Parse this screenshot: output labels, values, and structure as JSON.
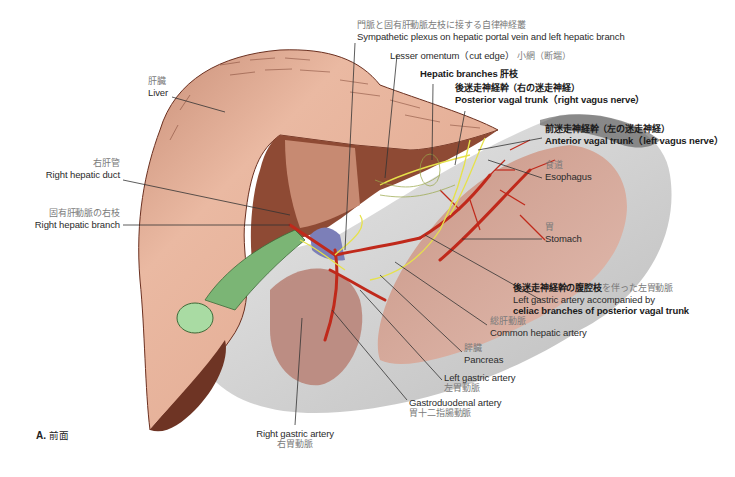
{
  "figure": {
    "caption_letter": "A.",
    "caption_text": "前面",
    "signature": "Netter"
  },
  "labels": {
    "sympathetic_plexus": {
      "jp": "門脈と固有肝動脈左枝に接する自律神経叢",
      "en": "Sympathetic plexus on hepatic portal vein and left hepatic branch"
    },
    "lesser_omentum": {
      "en": "Lesser omentum（cut edge）",
      "jp": "小網（断端）"
    },
    "hepatic_branches": {
      "en": "Hepatic branches",
      "jp": "肝枝"
    },
    "posterior_vagal_trunk": {
      "jp": "後迷走神経幹（右の迷走神経）",
      "en": "Posterior vagal trunk（right vagus nerve）"
    },
    "anterior_vagal_trunk": {
      "jp": "前迷走神経幹（左の迷走神経）",
      "en": "Anterior vagal trunk（left vagus nerve）"
    },
    "esophagus": {
      "jp": "食道",
      "en": "Esophagus"
    },
    "stomach": {
      "jp": "胃",
      "en": "Stomach"
    },
    "left_gastric_celiac": {
      "jp_bold": "後迷走神経幹の腹腔枝",
      "jp_rest": "を伴った左胃動脈",
      "en_line1": "Left gastric artery accompanied by",
      "en_line2": "celiac branches of posterior vagal trunk"
    },
    "common_hepatic_artery": {
      "jp": "総肝動脈",
      "en": "Common hepatic artery"
    },
    "pancreas": {
      "jp": "膵臓",
      "en": "Pancreas"
    },
    "left_gastric_artery": {
      "en": "Left gastric artery",
      "jp": "左胃動脈"
    },
    "gastroduodenal_artery": {
      "en": "Gastroduodenal artery",
      "jp": "胃十二指腸動脈"
    },
    "right_gastric_artery": {
      "en": "Right gastric artery",
      "jp": "右胃動脈"
    },
    "liver": {
      "jp": "肝臓",
      "en": "Liver"
    },
    "right_hepatic_duct": {
      "jp": "右肝管",
      "en": "Right hepatic duct"
    },
    "right_hepatic_branch": {
      "jp": "固有肝動脈の右枝",
      "en": "Right hepatic branch"
    }
  },
  "colors": {
    "liver": "#e8b8a0",
    "liver_dark": "#8a4a35",
    "stomach": "#d9c9c4",
    "peritoneum": "#d8d8d8",
    "gallbladder": "#8fc98a",
    "artery": "#c0291b",
    "nerve": "#e6e24a",
    "vein": "#7c7fb8",
    "leader": "#333333"
  }
}
